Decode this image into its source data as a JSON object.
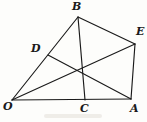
{
  "figure": {
    "kind": "geometry-diagram",
    "width": 147,
    "height": 122,
    "background_color": "#fdfdfb",
    "stroke_color": "#1a1a1a",
    "label_color": "#1a1a1a",
    "points": [
      {
        "id": "O",
        "label": "O",
        "x": 12,
        "y": 100,
        "label_x": 3,
        "label_y": 101
      },
      {
        "id": "A",
        "label": "A",
        "x": 131,
        "y": 99,
        "label_x": 130,
        "label_y": 103
      },
      {
        "id": "B",
        "label": "B",
        "x": 78,
        "y": 17,
        "label_x": 72,
        "label_y": 1
      },
      {
        "id": "C",
        "label": "C",
        "x": 85,
        "y": 100,
        "label_x": 80,
        "label_y": 103
      },
      {
        "id": "D",
        "label": "D",
        "x": 48,
        "y": 55,
        "label_x": 31,
        "label_y": 43
      },
      {
        "id": "E",
        "label": "E",
        "x": 135,
        "y": 44,
        "label_x": 136,
        "label_y": 26
      }
    ],
    "segments": [
      {
        "id": "O-A",
        "from": "O",
        "to": "A",
        "name": "segment-OA"
      },
      {
        "id": "O-B",
        "from": "O",
        "to": "B",
        "name": "segment-OB"
      },
      {
        "id": "O-E",
        "from": "O",
        "to": "E",
        "name": "segment-OE"
      },
      {
        "id": "B-E",
        "from": "B",
        "to": "E",
        "name": "segment-BE"
      },
      {
        "id": "B-C",
        "from": "B",
        "to": "C",
        "name": "segment-BC"
      },
      {
        "id": "E-A",
        "from": "E",
        "to": "A",
        "name": "segment-EA"
      },
      {
        "id": "D-A",
        "from": "D",
        "to": "A",
        "name": "segment-DA"
      }
    ]
  }
}
